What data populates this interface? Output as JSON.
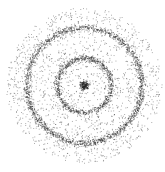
{
  "chart_data": {
    "type": "scatter",
    "title": "",
    "xlabel": "",
    "ylabel": "",
    "grid": false,
    "legend": null,
    "axes_visible": false,
    "center": [
      84,
      85
    ],
    "point_color": "#222222",
    "structures": [
      {
        "name": "center-cluster",
        "kind": "blob",
        "radius": 0,
        "spread": 2.2,
        "count": 120,
        "opacity": 0.9
      },
      {
        "name": "inner-ring",
        "kind": "ring",
        "radius": 27,
        "spread": 1.6,
        "count": 900,
        "opacity": 0.55
      },
      {
        "name": "outer-ring",
        "kind": "ring",
        "radius": 57.5,
        "spread": 1.8,
        "count": 1800,
        "opacity": 0.55
      },
      {
        "name": "background-noise",
        "kind": "disk",
        "radius": 78,
        "spread": 0,
        "count": 1700,
        "opacity": 0.45
      }
    ]
  }
}
